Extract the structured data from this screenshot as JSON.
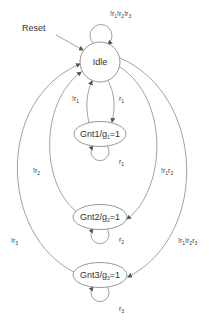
{
  "diagram": {
    "type": "state-machine",
    "colors": {
      "stroke": "#8a8a8a",
      "text": "#333333",
      "background": "#ffffff"
    },
    "reset_label": "Reset",
    "states": [
      {
        "id": "idle",
        "label": "Idle",
        "base": "Idle",
        "sub": "",
        "rest": ""
      },
      {
        "id": "gnt1",
        "label": "Gnt1/g1=1",
        "base": "Gnt1/g",
        "sub": "1",
        "rest": "=1"
      },
      {
        "id": "gnt2",
        "label": "Gnt2/g2=1",
        "base": "Gnt2/g",
        "sub": "2",
        "rest": "=1"
      },
      {
        "id": "gnt3",
        "label": "Gnt3/g3=1",
        "base": "Gnt3/g",
        "sub": "3",
        "rest": "=1"
      }
    ],
    "transitions": [
      {
        "from": "idle",
        "to": "idle",
        "label": "!r1!r2!r3"
      },
      {
        "from": "idle",
        "to": "gnt1",
        "label": "r1"
      },
      {
        "from": "gnt1",
        "to": "idle",
        "label": "!r1"
      },
      {
        "from": "gnt1",
        "to": "gnt1",
        "label": "r1"
      },
      {
        "from": "idle",
        "to": "gnt2",
        "label": "!r1r2"
      },
      {
        "from": "gnt2",
        "to": "idle",
        "label": "!r2"
      },
      {
        "from": "gnt2",
        "to": "gnt2",
        "label": "r2"
      },
      {
        "from": "idle",
        "to": "gnt3",
        "label": "!r1!r2r3"
      },
      {
        "from": "gnt3",
        "to": "idle",
        "label": "!r3"
      },
      {
        "from": "gnt3",
        "to": "gnt3",
        "label": "r3"
      }
    ],
    "labels": {
      "idle_loop": {
        "parts": [
          "!r",
          "1",
          "!r",
          "2",
          "!r",
          "3"
        ]
      },
      "idle_to_gnt1": {
        "parts": [
          "r",
          "1"
        ]
      },
      "gnt1_to_idle": {
        "parts": [
          "!r",
          "1"
        ]
      },
      "gnt1_loop": {
        "parts": [
          "r",
          "1"
        ]
      },
      "idle_to_gnt2": {
        "parts": [
          "!r",
          "1",
          "r",
          "2"
        ]
      },
      "gnt2_to_idle": {
        "parts": [
          "!r",
          "2"
        ]
      },
      "gnt2_loop": {
        "parts": [
          "r",
          "2"
        ]
      },
      "idle_to_gnt3": {
        "parts": [
          "!r",
          "1",
          "!r",
          "2",
          "r",
          "3"
        ]
      },
      "gnt3_to_idle": {
        "parts": [
          "!r",
          "3"
        ]
      },
      "gnt3_loop": {
        "parts": [
          "r",
          "3"
        ]
      }
    }
  }
}
